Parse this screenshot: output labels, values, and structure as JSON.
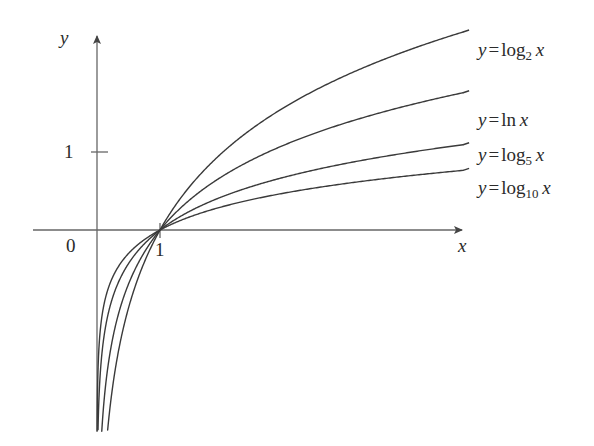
{
  "figure": {
    "background_color": "#ffffff",
    "line_color": "#3a3a3a",
    "axis_color": "#555555",
    "text_color": "#2b2b2b"
  },
  "axes": {
    "x_axis_label": "x",
    "y_axis_label": "y",
    "origin_label": "0",
    "x_tick_label": "1",
    "y_tick_label": "1",
    "x_axis_y_pixel": 230,
    "y_axis_x_pixel": 97,
    "unit_x_pixels": 63,
    "unit_y_pixels": 78
  },
  "curves": [
    {
      "id": "log2",
      "var": "y",
      "equals": "=",
      "fn": "log",
      "base": "2",
      "arg": "x",
      "label_text": "y = log2 x",
      "label_x": 478,
      "label_y": 40,
      "end_y_value": 2.84
    },
    {
      "id": "ln",
      "var": "y",
      "equals": "=",
      "fn": "ln",
      "base": "",
      "arg": "x",
      "label_text": "y = ln x",
      "label_x": 478,
      "label_y": 110,
      "end_y_value": 1.97
    },
    {
      "id": "log5",
      "var": "y",
      "equals": "=",
      "fn": "log",
      "base": "5",
      "arg": "x",
      "label_text": "y = log5 x",
      "label_x": 478,
      "label_y": 145,
      "end_y_value": 1.22
    },
    {
      "id": "log10",
      "var": "y",
      "equals": "=",
      "fn": "log",
      "base": "10",
      "arg": "x",
      "label_text": "y = log10 x",
      "label_x": 478,
      "label_y": 178,
      "end_y_value": 0.85
    }
  ],
  "chart_data": {
    "type": "line",
    "title": "",
    "xlabel": "x",
    "ylabel": "y",
    "xlim": [
      0,
      6
    ],
    "ylim": [
      -2.6,
      3.2
    ],
    "grid": false,
    "legend": "inline-right-of-curves",
    "annotations": [
      "0",
      "1",
      "1"
    ],
    "series": [
      {
        "name": "y = log2 x",
        "base": 2,
        "x": [
          0.04,
          0.1,
          0.2,
          0.35,
          0.5,
          0.7,
          1,
          1.5,
          2,
          2.5,
          3,
          3.5,
          4,
          4.5,
          5,
          5.5,
          5.9
        ],
        "values": [
          -4.64,
          -3.32,
          -2.32,
          -1.51,
          -1.0,
          -0.51,
          0,
          0.58,
          1.0,
          1.32,
          1.58,
          1.81,
          2.0,
          2.17,
          2.32,
          2.46,
          2.56
        ]
      },
      {
        "name": "y = ln x",
        "base": 2.718281828,
        "x": [
          0.04,
          0.1,
          0.2,
          0.35,
          0.5,
          0.7,
          1,
          1.5,
          2,
          2.5,
          3,
          3.5,
          4,
          4.5,
          5,
          5.5,
          5.9
        ],
        "values": [
          -3.22,
          -2.3,
          -1.61,
          -1.05,
          -0.69,
          -0.36,
          0,
          0.41,
          0.69,
          0.92,
          1.1,
          1.25,
          1.39,
          1.5,
          1.61,
          1.7,
          1.77
        ]
      },
      {
        "name": "y = log5 x",
        "base": 5,
        "x": [
          0.04,
          0.1,
          0.2,
          0.35,
          0.5,
          0.7,
          1,
          1.5,
          2,
          2.5,
          3,
          3.5,
          4,
          4.5,
          5,
          5.5,
          5.9
        ],
        "values": [
          -2.0,
          -1.43,
          -1.0,
          -0.65,
          -0.43,
          -0.22,
          0,
          0.25,
          0.43,
          0.57,
          0.68,
          0.78,
          0.86,
          0.93,
          1.0,
          1.06,
          1.1
        ]
      },
      {
        "name": "y = log10 x",
        "base": 10,
        "x": [
          0.04,
          0.1,
          0.2,
          0.35,
          0.5,
          0.7,
          1,
          1.5,
          2,
          2.5,
          3,
          3.5,
          4,
          4.5,
          5,
          5.5,
          5.9
        ],
        "values": [
          -1.4,
          -1.0,
          -0.7,
          -0.46,
          -0.3,
          -0.15,
          0,
          0.18,
          0.3,
          0.4,
          0.48,
          0.54,
          0.6,
          0.65,
          0.7,
          0.74,
          0.77
        ]
      }
    ]
  }
}
